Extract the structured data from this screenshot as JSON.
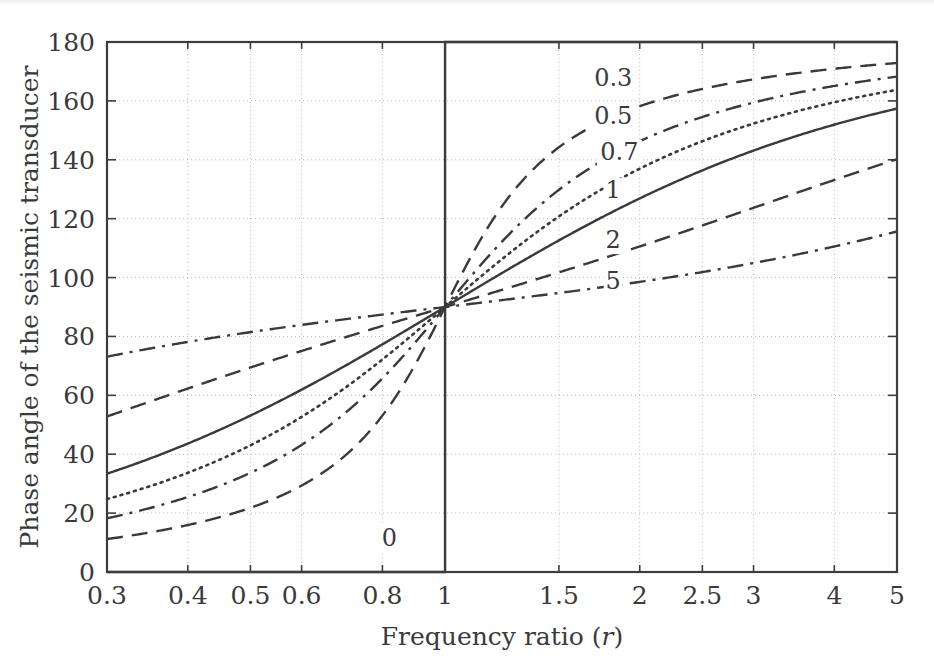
{
  "figure": {
    "title": "",
    "axis_labels": {
      "x": "Frequency ratio (r)",
      "x_prefix": "Frequency ratio (",
      "x_symbol": "r",
      "x_suffix": ")",
      "y": "Phase angle of the seismic transducer"
    },
    "colors": {
      "ink": "#3a3a3a",
      "axis": "#3d3d3d",
      "grid": "#b9b9b9",
      "background": "#ffffff"
    }
  },
  "chart_data": {
    "type": "line",
    "title": "",
    "xlabel": "Frequency ratio (r)",
    "ylabel": "Phase angle of the seismic transducer",
    "xscale": "log",
    "yscale": "linear",
    "xlim": [
      0.3,
      5
    ],
    "ylim": [
      0,
      180
    ],
    "grid": true,
    "legend": "inline-curve-labels",
    "xticks": [
      0.3,
      0.4,
      0.5,
      0.6,
      0.8,
      1,
      1.5,
      2,
      2.5,
      3,
      4,
      5
    ],
    "xticklabels": [
      "0.3",
      "0.4",
      "0.5",
      "0.6",
      "0.8",
      "1",
      "1.5",
      "2",
      "2.5",
      "3",
      "4",
      "5"
    ],
    "yticks": [
      0,
      20,
      40,
      60,
      80,
      100,
      120,
      140,
      160,
      180
    ],
    "yticklabels": [
      "0",
      "20",
      "40",
      "60",
      "80",
      "100",
      "120",
      "140",
      "160",
      "180"
    ],
    "formula": "phase = atan2(2*zeta*r, 1 - r*r) in degrees",
    "series": [
      {
        "name": "0",
        "label": "0",
        "zeta": 0,
        "style": "solid",
        "label_pos": {
          "r": 0.82,
          "phase": 9
        },
        "x": [
          0.3,
          0.5,
          0.8,
          0.99,
          1.0,
          1.0,
          1.01,
          1.5,
          3,
          5
        ],
        "values": [
          0,
          0,
          0,
          0,
          0,
          180,
          180,
          180,
          180,
          180
        ]
      },
      {
        "name": "0.3",
        "label": "0.3",
        "zeta": 0.3,
        "style": "dashed",
        "label_pos": {
          "r": 1.82,
          "phase": 165
        },
        "x": [
          0.3,
          0.4,
          0.5,
          0.6,
          0.8,
          1,
          1.5,
          2,
          2.5,
          3,
          4,
          5
        ],
        "values": [
          11.3,
          15.6,
          21.8,
          31.6,
          61.9,
          90,
          133.0,
          146.3,
          152.9,
          156.8,
          161.4,
          164.1
        ]
      },
      {
        "name": "0.5",
        "label": "0.5",
        "zeta": 0.5,
        "style": "dashdot",
        "label_pos": {
          "r": 1.82,
          "phase": 152
        },
        "x": [
          0.3,
          0.4,
          0.5,
          0.6,
          0.8,
          1,
          1.5,
          2,
          2.5,
          3,
          4,
          5
        ],
        "values": [
          18.3,
          25.5,
          33.7,
          43.2,
          66.0,
          90,
          123.7,
          146.3,
          150.3,
          155.0,
          160.1,
          163.2
        ]
      },
      {
        "name": "0.7",
        "label": "0.7",
        "zeta": 0.7,
        "style": "dotted",
        "label_pos": {
          "r": 1.86,
          "phase": 140
        },
        "x": [
          0.3,
          0.4,
          0.5,
          0.6,
          0.8,
          1,
          1.5,
          2,
          2.5,
          3,
          4,
          5
        ],
        "values": [
          24.8,
          34.0,
          43.0,
          52.7,
          71.3,
          90,
          117.8,
          130.0,
          137.0,
          141.7,
          147.4,
          151.0
        ]
      },
      {
        "name": "1",
        "label": "1",
        "zeta": 1,
        "style": "solid",
        "label_pos": {
          "r": 1.82,
          "phase": 127
        },
        "x": [
          0.3,
          0.4,
          0.5,
          0.6,
          0.8,
          1,
          1.5,
          2,
          2.5,
          3,
          4,
          5
        ],
        "values": [
          33.4,
          43.6,
          53.1,
          61.9,
          77.3,
          90,
          112.6,
          126.9,
          135.5,
          143.1,
          151.9,
          157.4
        ]
      },
      {
        "name": "2",
        "label": "2",
        "zeta": 2,
        "style": "dashed",
        "label_pos": {
          "r": 1.82,
          "phase": 110
        },
        "x": [
          0.3,
          0.4,
          0.5,
          0.6,
          0.8,
          1,
          1.5,
          2,
          2.5,
          3,
          4,
          5
        ],
        "values": [
          53.4,
          64.4,
          69.4,
          74.3,
          82.4,
          90,
          103.2,
          110.6,
          117.4,
          123.7,
          132.0,
          140.1
        ]
      },
      {
        "name": "5",
        "label": "5",
        "zeta": 5,
        "style": "dashdot",
        "label_pos": {
          "r": 1.82,
          "phase": 96
        },
        "x": [
          0.3,
          0.4,
          0.5,
          0.6,
          0.8,
          1,
          1.5,
          2,
          2.5,
          3,
          4,
          5
        ],
        "values": [
          73.7,
          78.6,
          81.0,
          82.8,
          85.8,
          90,
          95.2,
          100.6,
          105.4,
          109.8,
          117.0,
          123.1
        ]
      }
    ],
    "annotations": [
      {
        "text": "0.3",
        "r": 1.82,
        "phase": 165
      },
      {
        "text": "0.5",
        "r": 1.82,
        "phase": 152
      },
      {
        "text": "0.7",
        "r": 1.86,
        "phase": 140
      },
      {
        "text": "1",
        "r": 1.82,
        "phase": 127
      },
      {
        "text": "2",
        "r": 1.82,
        "phase": 110
      },
      {
        "text": "5",
        "r": 1.82,
        "phase": 96
      },
      {
        "text": "0",
        "r": 0.82,
        "phase": 9
      }
    ]
  }
}
